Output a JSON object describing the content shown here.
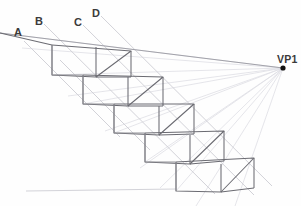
{
  "figure": {
    "type": "one-point-perspective-construction",
    "background_color": "#fefefe",
    "width": 301,
    "height": 206
  },
  "labels": {
    "a": {
      "text": "A",
      "x": 14,
      "y": 26
    },
    "b": {
      "text": "B",
      "x": 35,
      "y": 15
    },
    "c": {
      "text": "C",
      "x": 74,
      "y": 16
    },
    "d": {
      "text": "D",
      "x": 92,
      "y": 7
    },
    "vp1": {
      "text": "VP1",
      "x": 277,
      "y": 53
    }
  },
  "vanishing_point": {
    "name": "VP1",
    "x": 283,
    "y": 68,
    "dot_radius": 2.6,
    "color": "#111111"
  },
  "colors": {
    "solid_line": "#6b6b72",
    "medium_line": "#8d8d94",
    "guide_line": "#c9c9d0",
    "faint_line": "#dedee4",
    "label_text": "#3a3a3a",
    "vp_dot": "#111111"
  },
  "construction_lines": {
    "horizon_from_a": {
      "from": [
        0,
        33
      ],
      "to": [
        283,
        68
      ]
    },
    "ground_line": {
      "from": [
        28,
        191
      ],
      "to": [
        160,
        188
      ]
    },
    "measuring_lines": [
      {
        "label": "B",
        "from": [
          44,
          24
        ],
        "to": [
          205,
          183
        ]
      },
      {
        "label": "C",
        "from": [
          83,
          25
        ],
        "to": [
          244,
          184
        ]
      },
      {
        "label": "D",
        "from": [
          101,
          16
        ],
        "to": [
          262,
          175
        ]
      }
    ]
  },
  "steps": [
    {
      "index": 1,
      "riser_top": [
        52,
        45
      ],
      "riser_bottom": [
        52,
        75
      ],
      "front_right": [
        96,
        77
      ],
      "back_right_top": [
        131,
        51
      ]
    },
    {
      "index": 2,
      "riser_top": [
        83,
        75
      ],
      "riser_bottom": [
        83,
        104
      ],
      "front_right": [
        128,
        106
      ],
      "back_right_top": [
        163,
        77
      ]
    },
    {
      "index": 3,
      "riser_top": [
        114,
        104
      ],
      "riser_bottom": [
        114,
        133
      ],
      "front_right": [
        159,
        135
      ],
      "back_right_top": [
        194,
        104
      ]
    },
    {
      "index": 4,
      "riser_top": [
        145,
        133
      ],
      "riser_bottom": [
        145,
        162
      ],
      "front_right": [
        190,
        164
      ],
      "back_right_top": [
        224,
        131
      ]
    },
    {
      "index": 5,
      "riser_top": [
        176,
        162
      ],
      "riser_bottom": [
        176,
        191
      ],
      "front_right": [
        221,
        192
      ],
      "back_right_top": [
        254,
        158
      ]
    }
  ],
  "vp_rays": {
    "count": 11,
    "description": "faint perspective guide lines converging at VP1"
  }
}
